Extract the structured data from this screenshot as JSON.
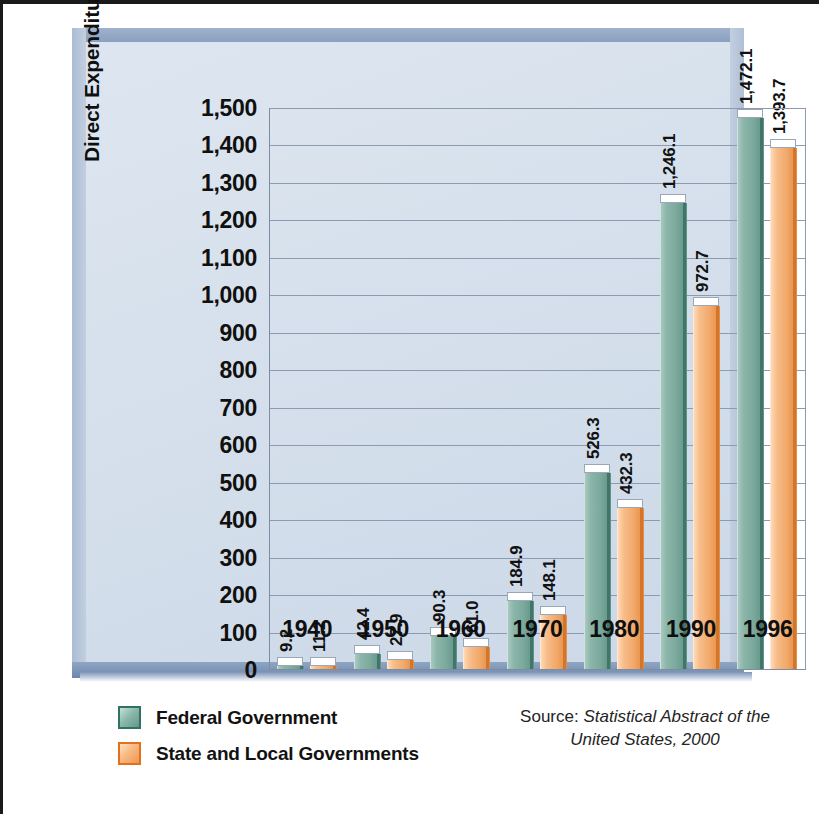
{
  "chart_data": {
    "type": "bar",
    "title": "",
    "xlabel": "",
    "ylabel": "Direct Expenditures (in billions of dollars)",
    "categories": [
      "1940",
      "1950",
      "1960",
      "1970",
      "1980",
      "1990",
      "1996"
    ],
    "series": [
      {
        "name": "Federal Government",
        "color": "#7aa99c",
        "values": [
          9.2,
          42.4,
          90.3,
          184.9,
          526.3,
          1246.1,
          1472.1
        ],
        "labels": [
          "9.2",
          "42.4",
          "90.3",
          "184.9",
          "526.3",
          "1,246.1",
          "1,472.1"
        ]
      },
      {
        "name": "State and Local Governments",
        "color": "#f2a969",
        "values": [
          11.2,
          27.9,
          61.0,
          148.1,
          432.3,
          972.7,
          1393.7
        ],
        "labels": [
          "11.2",
          "27.9",
          "61.0",
          "148.1",
          "432.3",
          "972.7",
          "1,393.7"
        ]
      }
    ],
    "ylim": [
      0,
      1500
    ],
    "ytick_values": [
      0,
      100,
      200,
      300,
      400,
      500,
      600,
      700,
      800,
      900,
      1000,
      1100,
      1200,
      1300,
      1400,
      1500
    ],
    "ytick_labels": [
      "0",
      "100",
      "200",
      "300",
      "400",
      "500",
      "600",
      "700",
      "800",
      "900",
      "1,000",
      "1,100",
      "1,200",
      "1,300",
      "1,400",
      "1,500"
    ],
    "grid": true,
    "grid_axis": "y",
    "legend_position": "bottom-left",
    "style": "3d-bar",
    "background_color": "#d6e0ec",
    "frame_color": "#c3cfe0"
  },
  "legend": {
    "items": [
      {
        "label": "Federal Government",
        "swatch": "fed"
      },
      {
        "label": "State and Local Governments",
        "swatch": "sl"
      }
    ]
  },
  "source": {
    "prefix": "Source:",
    "title_line1": "Statistical Abstract of the",
    "title_line2": "United States, 2000"
  }
}
